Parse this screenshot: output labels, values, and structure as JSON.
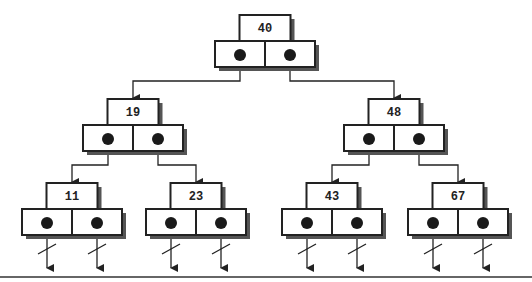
{
  "diagram": {
    "type": "binary-search-tree",
    "nodes": [
      {
        "id": "n40",
        "key": "40",
        "x": 265,
        "y": 15,
        "left": "n19",
        "right": "n48"
      },
      {
        "id": "n19",
        "key": "19",
        "x": 133,
        "y": 99,
        "left": "n11",
        "right": "n23"
      },
      {
        "id": "n48",
        "key": "48",
        "x": 394,
        "y": 99,
        "left": "n43",
        "right": "n67"
      },
      {
        "id": "n11",
        "key": "11",
        "x": 72,
        "y": 183,
        "left": null,
        "right": null
      },
      {
        "id": "n23",
        "key": "23",
        "x": 196,
        "y": 183,
        "left": null,
        "right": null
      },
      {
        "id": "n43",
        "key": "43",
        "x": 332,
        "y": 183,
        "left": null,
        "right": null
      },
      {
        "id": "n67",
        "key": "67",
        "x": 458,
        "y": 183,
        "left": null,
        "right": null
      }
    ],
    "null_pointer_symbol": "slash-arrow",
    "colors": {
      "line": "#222222",
      "shadow": "#555555",
      "fill": "#ffffff",
      "dot": "#1a1a1a"
    }
  }
}
